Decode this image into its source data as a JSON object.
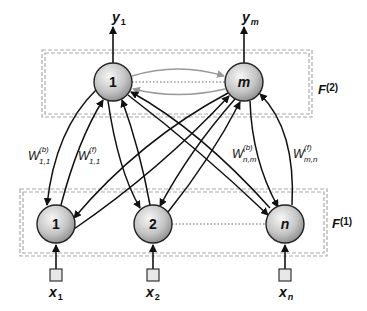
{
  "diagram": {
    "type": "neural-network",
    "layers": [
      {
        "id": "F2",
        "label": "F",
        "superscript": "(2)",
        "nodes": [
          {
            "id": "top-1",
            "label": "1",
            "italic": false,
            "output": {
              "name": "y",
              "subscript": "1"
            }
          },
          {
            "id": "top-m",
            "label": "m",
            "italic": true,
            "output": {
              "name": "y",
              "subscript": "m"
            }
          }
        ]
      },
      {
        "id": "F1",
        "label": "F",
        "superscript": "(1)",
        "nodes": [
          {
            "id": "bot-1",
            "label": "1",
            "italic": false,
            "input": {
              "name": "x",
              "subscript": "1"
            }
          },
          {
            "id": "bot-2",
            "label": "2",
            "italic": false,
            "input": {
              "name": "x",
              "subscript": "2"
            }
          },
          {
            "id": "bot-n",
            "label": "n",
            "italic": true,
            "input": {
              "name": "x",
              "subscript": "n"
            }
          }
        ]
      }
    ],
    "weights": [
      {
        "id": "w-b-11",
        "name": "W",
        "superscript": "(b)",
        "subscript": "1,1"
      },
      {
        "id": "w-f-11",
        "name": "W",
        "superscript": "(f)",
        "subscript": "1,1"
      },
      {
        "id": "w-b-nm",
        "name": "W",
        "superscript": "(b)",
        "subscript": "n,m"
      },
      {
        "id": "w-f-mn",
        "name": "W",
        "superscript": "(f)",
        "subscript": "m,n"
      }
    ],
    "colors": {
      "node_fill_light": "#f2f2f2",
      "node_fill_dark": "#8a8a8a",
      "edge": "#111111",
      "lateral_edge": "#999999",
      "box_dash": "#aaaaaa"
    }
  }
}
